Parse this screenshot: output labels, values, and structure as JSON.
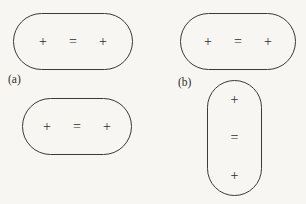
{
  "figure": {
    "background_color": "#f7f6f2",
    "stroke_color": "#3a3a38",
    "text_color": "#2e2e2c",
    "panels": [
      {
        "label": "(a)",
        "shapes": [
          {
            "name": "capsule-a1",
            "orientation": "horizontal",
            "symbols": [
              "+",
              "=",
              "+"
            ]
          },
          {
            "name": "capsule-a2",
            "orientation": "horizontal",
            "symbols": [
              "+",
              "=",
              "+"
            ]
          }
        ]
      },
      {
        "label": "(b)",
        "shapes": [
          {
            "name": "capsule-b1",
            "orientation": "horizontal",
            "symbols": [
              "+",
              "=",
              "+"
            ]
          },
          {
            "name": "capsule-b2",
            "orientation": "vertical",
            "symbols": [
              "+",
              "=",
              "+"
            ]
          }
        ]
      }
    ]
  },
  "symbols": {
    "plus": "+",
    "equals": "="
  }
}
